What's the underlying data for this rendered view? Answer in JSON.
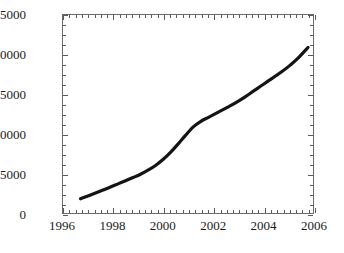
{
  "chart_data": {
    "type": "line",
    "title": "",
    "xlabel": "",
    "ylabel": "",
    "xlim": [
      1996,
      2006
    ],
    "ylim": [
      0,
      25000
    ],
    "grid": false,
    "legend": null,
    "x_ticks": [
      "1996",
      "1998",
      "2000",
      "2002",
      "2004",
      "2006"
    ],
    "x_tick_values": [
      1996,
      1998,
      2000,
      2002,
      2004,
      2006
    ],
    "x_minor_interval": 0.25,
    "y_ticks": [
      "0",
      "5000",
      "10000",
      "15000",
      "20000",
      "25000"
    ],
    "y_tick_values": [
      0,
      5000,
      10000,
      15000,
      20000,
      25000
    ],
    "y_minor_interval": 1250,
    "series": [
      {
        "name": "series-1",
        "color": "#141414",
        "line_width": 3.2,
        "x": [
          1996.7,
          1997.0,
          1997.3,
          1997.6,
          1997.9,
          1998.2,
          1998.5,
          1998.8,
          1999.1,
          1999.4,
          1999.7,
          2000.0,
          2000.3,
          2000.6,
          2000.9,
          2001.2,
          2001.5,
          2001.8,
          2002.1,
          2002.4,
          2002.7,
          2003.0,
          2003.3,
          2003.6,
          2003.9,
          2004.2,
          2004.5,
          2004.8,
          2005.1,
          2005.4,
          2005.8
        ],
        "y": [
          1800,
          2150,
          2520,
          2900,
          3280,
          3680,
          4080,
          4480,
          4900,
          5400,
          6000,
          6750,
          7650,
          8700,
          9800,
          10850,
          11550,
          12050,
          12550,
          13050,
          13550,
          14100,
          14700,
          15350,
          16000,
          16650,
          17300,
          17950,
          18700,
          19550,
          20900
        ]
      }
    ]
  }
}
